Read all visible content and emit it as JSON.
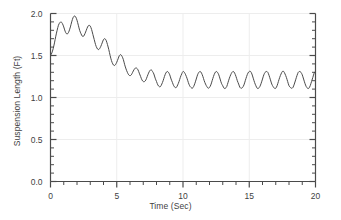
{
  "chart_data": {
    "type": "line",
    "title": "",
    "xlabel": "Time (Sec)",
    "ylabel": "Suspension Length (Ft)",
    "xlim": [
      0,
      20
    ],
    "ylim": [
      0,
      2.0
    ],
    "xticks": [
      0,
      5,
      10,
      15,
      20
    ],
    "yticks": [
      0.0,
      0.5,
      1.0,
      1.5,
      2.0
    ],
    "xtick_labels": [
      "0",
      "5",
      "10",
      "15",
      "20"
    ],
    "ytick_labels": [
      "0.0",
      "0.5",
      "1.0",
      "1.5",
      "2.0"
    ],
    "x_minor_tick_step": 1,
    "y_minor_tick_step": 0.1,
    "grid": true,
    "grid_color": "#ededed",
    "legend": "none",
    "line_color": "#4a4a4a",
    "line_width": 1.0,
    "axis_color": "#4a4a4a",
    "background_color": "#ffffff",
    "series": [
      {
        "name": "Suspension Length",
        "x": [
          0.0,
          0.1,
          0.2,
          0.3,
          0.4,
          0.5,
          0.6,
          0.7,
          0.8,
          0.9,
          1.0,
          1.1,
          1.2,
          1.3,
          1.4,
          1.5,
          1.6,
          1.7,
          1.8,
          1.9,
          2.0,
          2.1,
          2.2,
          2.3,
          2.4,
          2.5,
          2.6,
          2.7,
          2.8,
          2.9,
          3.0,
          3.1,
          3.2,
          3.3,
          3.4,
          3.5,
          3.6,
          3.7,
          3.8,
          3.9,
          4.0,
          4.1,
          4.2,
          4.3,
          4.4,
          4.5,
          4.6,
          4.7,
          4.8,
          4.9,
          5.0,
          5.1,
          5.2,
          5.3,
          5.4,
          5.5,
          5.6,
          5.7,
          5.8,
          5.9,
          6.0,
          6.1,
          6.2,
          6.3,
          6.4,
          6.5,
          6.6,
          6.7,
          6.8,
          6.9,
          7.0,
          7.1,
          7.2,
          7.3,
          7.4,
          7.5,
          7.6,
          7.7,
          7.8,
          7.9,
          8.0,
          8.1,
          8.2,
          8.3,
          8.4,
          8.5,
          8.6,
          8.7,
          8.8,
          8.9,
          9.0,
          9.1,
          9.2,
          9.3,
          9.4,
          9.5,
          9.6,
          9.7,
          9.8,
          9.9,
          10.0,
          10.1,
          10.2,
          10.3,
          10.4,
          10.5,
          10.6,
          10.7,
          10.8,
          10.9,
          11.0,
          11.1,
          11.2,
          11.3,
          11.4,
          11.5,
          11.6,
          11.7,
          11.8,
          11.9,
          12.0,
          12.1,
          12.2,
          12.3,
          12.4,
          12.5,
          12.6,
          12.7,
          12.8,
          12.9,
          13.0,
          13.1,
          13.2,
          13.3,
          13.4,
          13.5,
          13.6,
          13.7,
          13.8,
          13.9,
          14.0,
          14.1,
          14.2,
          14.3,
          14.4,
          14.5,
          14.6,
          14.7,
          14.8,
          14.9,
          15.0,
          15.1,
          15.2,
          15.3,
          15.4,
          15.5,
          15.6,
          15.7,
          15.8,
          15.9,
          16.0,
          16.1,
          16.2,
          16.3,
          16.4,
          16.5,
          16.6,
          16.7,
          16.8,
          16.9,
          17.0,
          17.1,
          17.2,
          17.3,
          17.4,
          17.5,
          17.6,
          17.7,
          17.8,
          17.9,
          18.0,
          18.1,
          18.2,
          18.3,
          18.4,
          18.5,
          18.6,
          18.7,
          18.8,
          18.9,
          19.0,
          19.1,
          19.2,
          19.3,
          19.4,
          19.5,
          19.6,
          19.7,
          19.8,
          19.9,
          20.0
        ],
        "y": [
          1.5,
          1.53,
          1.58,
          1.65,
          1.73,
          1.8,
          1.86,
          1.89,
          1.9,
          1.88,
          1.84,
          1.79,
          1.76,
          1.76,
          1.79,
          1.84,
          1.9,
          1.95,
          1.97,
          1.96,
          1.92,
          1.86,
          1.8,
          1.76,
          1.73,
          1.73,
          1.76,
          1.8,
          1.84,
          1.86,
          1.85,
          1.81,
          1.75,
          1.69,
          1.63,
          1.59,
          1.57,
          1.58,
          1.61,
          1.65,
          1.69,
          1.7,
          1.68,
          1.63,
          1.57,
          1.5,
          1.44,
          1.4,
          1.38,
          1.39,
          1.42,
          1.46,
          1.5,
          1.51,
          1.49,
          1.45,
          1.39,
          1.34,
          1.3,
          1.27,
          1.26,
          1.27,
          1.3,
          1.33,
          1.35,
          1.35,
          1.33,
          1.29,
          1.25,
          1.21,
          1.19,
          1.19,
          1.21,
          1.25,
          1.29,
          1.32,
          1.33,
          1.31,
          1.28,
          1.23,
          1.19,
          1.15,
          1.13,
          1.13,
          1.16,
          1.2,
          1.25,
          1.29,
          1.31,
          1.3,
          1.27,
          1.22,
          1.18,
          1.14,
          1.12,
          1.12,
          1.15,
          1.19,
          1.24,
          1.28,
          1.31,
          1.3,
          1.27,
          1.23,
          1.18,
          1.14,
          1.12,
          1.11,
          1.13,
          1.17,
          1.22,
          1.27,
          1.3,
          1.31,
          1.29,
          1.25,
          1.2,
          1.16,
          1.13,
          1.11,
          1.12,
          1.15,
          1.2,
          1.25,
          1.29,
          1.31,
          1.3,
          1.27,
          1.22,
          1.17,
          1.14,
          1.11,
          1.11,
          1.13,
          1.18,
          1.23,
          1.27,
          1.3,
          1.31,
          1.29,
          1.25,
          1.2,
          1.16,
          1.12,
          1.11,
          1.12,
          1.15,
          1.2,
          1.25,
          1.29,
          1.31,
          1.31,
          1.28,
          1.23,
          1.18,
          1.14,
          1.11,
          1.11,
          1.13,
          1.17,
          1.22,
          1.27,
          1.3,
          1.31,
          1.3,
          1.26,
          1.21,
          1.16,
          1.13,
          1.11,
          1.11,
          1.14,
          1.19,
          1.24,
          1.28,
          1.31,
          1.31,
          1.28,
          1.24,
          1.19,
          1.14,
          1.12,
          1.11,
          1.12,
          1.16,
          1.21,
          1.26,
          1.3,
          1.31,
          1.3,
          1.27,
          1.22,
          1.17,
          1.13,
          1.11,
          1.11,
          1.14,
          1.19,
          1.24,
          1.29,
          1.31
        ]
      }
    ],
    "annotations": {
      "initial_value": 1.5,
      "peak_value": 1.97,
      "peak_time": 1.8,
      "steady_state_center": 1.21,
      "steady_state_min": 1.11,
      "steady_state_max": 1.31,
      "steady_state_period": 0.55
    }
  }
}
